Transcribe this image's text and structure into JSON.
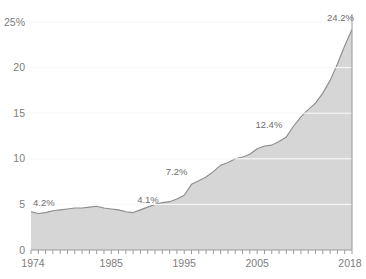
{
  "chart_data": {
    "type": "area",
    "title": "",
    "subtitle": "",
    "xlabel": "",
    "ylabel": "",
    "xlim": [
      1974,
      2018
    ],
    "ylim": [
      0,
      25
    ],
    "grid": true,
    "legend_position": "none",
    "y_ticks": [
      {
        "value": 25,
        "label": "25%"
      },
      {
        "value": 20,
        "label": "20"
      },
      {
        "value": 15,
        "label": "15"
      },
      {
        "value": 10,
        "label": "10"
      },
      {
        "value": 5,
        "label": "5"
      },
      {
        "value": 0,
        "label": "0"
      }
    ],
    "x_ticks": [
      {
        "value": 1974,
        "label": "1974"
      },
      {
        "value": 1985,
        "label": "1985"
      },
      {
        "value": 1995,
        "label": "1995"
      },
      {
        "value": 2005,
        "label": "2005"
      },
      {
        "value": 2018,
        "label": "2018"
      }
    ],
    "x": [
      1974,
      1975,
      1976,
      1977,
      1978,
      1979,
      1980,
      1981,
      1982,
      1983,
      1984,
      1985,
      1986,
      1987,
      1988,
      1989,
      1990,
      1991,
      1992,
      1993,
      1994,
      1995,
      1996,
      1997,
      1998,
      1999,
      2000,
      2001,
      2002,
      2003,
      2004,
      2005,
      2006,
      2007,
      2008,
      2009,
      2010,
      2011,
      2012,
      2013,
      2014,
      2015,
      2016,
      2017,
      2018
    ],
    "values": [
      4.2,
      4.0,
      4.1,
      4.3,
      4.4,
      4.5,
      4.6,
      4.6,
      4.7,
      4.8,
      4.6,
      4.5,
      4.4,
      4.2,
      4.1,
      4.4,
      4.7,
      5.0,
      5.2,
      5.3,
      5.6,
      6.0,
      7.2,
      7.6,
      8.0,
      8.6,
      9.3,
      9.6,
      10.0,
      10.2,
      10.5,
      11.1,
      11.4,
      11.5,
      11.9,
      12.4,
      13.6,
      14.6,
      15.4,
      16.1,
      17.2,
      18.6,
      20.4,
      22.4,
      24.2
    ],
    "annotations": [
      {
        "x": 1974,
        "y": 4.2,
        "label": "4.2%"
      },
      {
        "x": 1988,
        "y": 4.1,
        "label": "4.1%"
      },
      {
        "x": 1996,
        "y": 7.2,
        "label": "7.2%"
      },
      {
        "x": 2009,
        "y": 12.4,
        "label": "12.4%"
      },
      {
        "x": 2018,
        "y": 24.2,
        "label": "24.2%"
      }
    ],
    "colors": {
      "area_fill": "#d6d6d6",
      "line": "#8c8c8c",
      "grid": "#f2f2f2",
      "axis": "#9a9a9a",
      "text": "#7d7d7d"
    }
  }
}
